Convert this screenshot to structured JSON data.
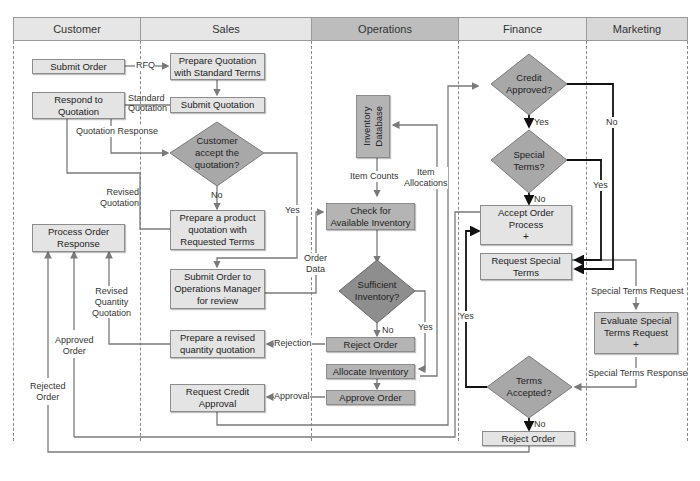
{
  "lanes": [
    {
      "name": "Customer"
    },
    {
      "name": "Sales"
    },
    {
      "name": "Operations"
    },
    {
      "name": "Finance"
    },
    {
      "name": "Marketing"
    }
  ],
  "processes": {
    "submit_order": "Submit Order",
    "prepare_quotation": "Prepare Quotation\nwith Standard Terms",
    "respond_quotation": "Respond to\nQuotation",
    "submit_quotation": "Submit Quotation",
    "process_order_response": "Process Order\nResponse",
    "prepare_product_quotation": "Prepare a product\nquotation with\nRequested Terms",
    "submit_order_ops": "Submit Order to\nOperations Manager\nfor review",
    "prepare_revised_qty": "Prepare a revised\nquantity quotation",
    "request_credit": "Request Credit\nApproval",
    "inventory_db": "Inventory\nDatabase",
    "check_inventory": "Check for\nAvailable Inventory",
    "reject_order_ops": "Reject Order",
    "allocate_inventory": "Allocate Inventory",
    "approve_order": "Approve Order",
    "accept_order": "Accept Order\nProcess",
    "accept_order_plus": "+",
    "request_special": "Request Special\nTerms",
    "evaluate_special": "Evaluate Special\nTerms Request",
    "evaluate_special_plus": "+",
    "reject_order_fin": "Reject Order"
  },
  "decisions": {
    "customer_accept": "Customer\naccept the\nquotation?",
    "sufficient_inventory": "Sufficient\nInventory?",
    "credit_approved": "Credit\nApproved?",
    "special_terms": "Special\nTerms?",
    "terms_accepted": "Terms\nAccepted?"
  },
  "flow_labels": {
    "rfq": "RFQ",
    "standard_quotation": "Standard\nQuotation",
    "quotation_response": "Quotation Response",
    "revised_quotation": "Revised\nQuotation",
    "no_customer": "No",
    "yes_customer": "Yes",
    "revised_qty_quotation": "Revised\nQuantity\nQuotation",
    "approved_order": "Approved\nOrder",
    "rejected_order": "Rejected\nOrder",
    "rejection": "Rejection",
    "approval": "Approval",
    "order_data": "Order\nData",
    "item_counts": "Item Counts",
    "item_allocations": "Item\nAllocations",
    "no_inventory": "No",
    "yes_inventory": "Yes",
    "yes_credit": "Yes",
    "no_credit": "No",
    "no_special": "No",
    "yes_special": "Yes",
    "yes_terms": "Yes",
    "no_terms": "No",
    "special_terms_request": "Special Terms Request",
    "special_terms_response": "Special Terms Response"
  },
  "colors": {
    "light_box": "#e4e4e4",
    "mid_box": "#cfcfcf",
    "dark_box": "#b4b4b4",
    "diamond_light": "#a8a8a8",
    "diamond_dark": "#8e8e8e",
    "connector": "#7a7a7a",
    "connector_bold": "#111111"
  }
}
